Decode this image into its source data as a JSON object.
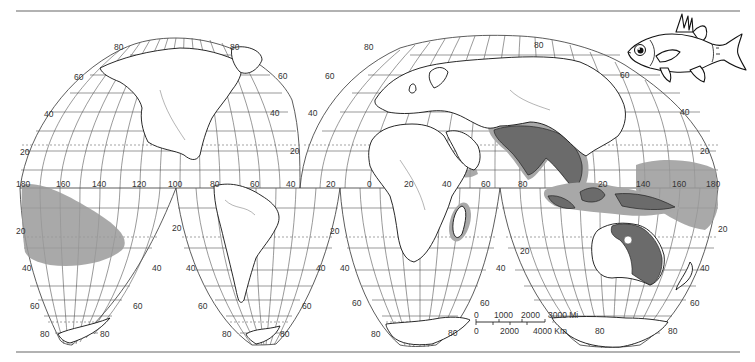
{
  "figure": {
    "type": "distribution-map",
    "projection": "interrupted homolosine (world, two visible lobes per hemisphere)",
    "subject_icon": "fish-illustration",
    "range_color": "#9a9a9a",
    "range_dark_color": "#6b6b6b"
  },
  "labels": {
    "north_left_lobe": {
      "lat_80_left": "80",
      "lat_80_right": "80",
      "lat_60_left": "60",
      "lat_60_right": "60",
      "lat_40_left": "40",
      "lat_40_right": "40",
      "lat_20_left": "20",
      "lat_20_right": "20"
    },
    "north_right_lobe": {
      "lat_80_left": "80",
      "lat_80_right": "80",
      "lat_60_left": "60",
      "lat_60_right": "60",
      "lat_40_left": "40",
      "lat_40_right": "40",
      "lat_20_left": "20",
      "lat_20_right": "20"
    },
    "equator_longitudes": [
      "180",
      "160",
      "140",
      "120",
      "100",
      "80",
      "60",
      "40",
      "20",
      "0",
      "20",
      "40",
      "60",
      "80",
      "20",
      "140",
      "160",
      "180"
    ],
    "south": {
      "lat_20": "20",
      "lat_40": "40",
      "lat_60": "60",
      "lat_80": "80"
    }
  },
  "scale_bar": {
    "miles_labels": [
      "0",
      "1000",
      "2000",
      "3000 Mi"
    ],
    "km_labels": [
      "0",
      "2000",
      "4000 Km"
    ]
  },
  "ranges": [
    {
      "name": "central-pacific-range",
      "description": "Central Pacific (Hawaii to Polynesia)"
    },
    {
      "name": "indo-malayan-range",
      "description": "India, Southeast Asia, Indonesia, New Guinea"
    },
    {
      "name": "northern-australia-range",
      "description": "Northern and eastern Australia"
    },
    {
      "name": "western-pacific-range",
      "description": "Western Pacific islands east of New Guinea"
    },
    {
      "name": "madagascar-range",
      "description": "Madagascar coast"
    },
    {
      "name": "red-sea-range",
      "description": "Red Sea / Arabian coast"
    }
  ]
}
